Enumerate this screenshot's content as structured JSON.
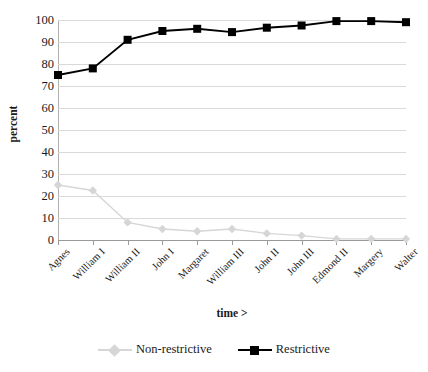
{
  "chart_data": {
    "type": "line",
    "title": "",
    "xlabel": "time >",
    "ylabel": "percent",
    "ylim": [
      0,
      100
    ],
    "ytick_labels": [
      "100",
      "90",
      "80",
      "70",
      "60",
      "50",
      "40",
      "30",
      "20",
      "10",
      "0"
    ],
    "ytick_values": [
      100,
      90,
      80,
      70,
      60,
      50,
      40,
      30,
      20,
      10,
      0
    ],
    "grid": true,
    "legend_position": "bottom",
    "categories": [
      "Agnes",
      "William I",
      "William II",
      "John I",
      "Margaret",
      "William III",
      "John II",
      "John III",
      "Edmond II",
      "Margery",
      "Walter"
    ],
    "series": [
      {
        "name": "Non-restrictive",
        "color": "#d6d6d6",
        "marker": "diamond",
        "values": [
          25,
          22.5,
          8,
          5,
          4,
          5,
          3,
          2,
          0.5,
          0.5,
          0.5
        ]
      },
      {
        "name": "Restrictive",
        "color": "#000000",
        "marker": "square",
        "values": [
          75,
          78,
          91,
          95,
          96,
          94.5,
          96.5,
          97.5,
          99.5,
          99.5,
          99
        ]
      }
    ]
  }
}
